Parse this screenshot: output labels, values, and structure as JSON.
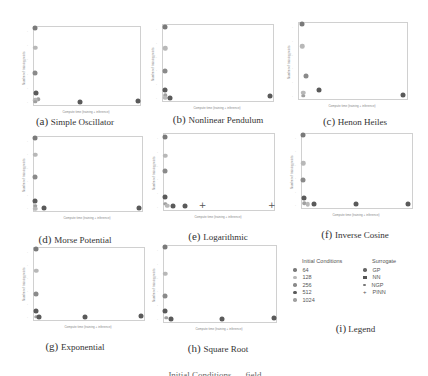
{
  "figure": {
    "bottom_caption_partial": "… Initial Conditions … field …"
  },
  "colors": {
    "ic_64": "#7a7a7a",
    "ic_128": "#b8b8b8",
    "ic_256": "#8a8a8a",
    "ic_512": "#5a5a5a",
    "ic_1024": "#a0a0a0",
    "GP": "#666666",
    "NN": "#555555",
    "NGP": "#777777",
    "PINN": "#555555"
  },
  "legend": {
    "caption_tag": "(i)",
    "caption_text": "Legend",
    "initial_conditions_title": "Initial Conditions",
    "initial_conditions": [
      "64",
      "128",
      "256",
      "512",
      "1024"
    ],
    "surrogate_title": "Surrogate",
    "surrogates": [
      "GP",
      "NN",
      "NGP",
      "PINN"
    ]
  },
  "chart_data": [
    {
      "type": "scatter",
      "id": "a",
      "title": "Simple Oscillator",
      "caption_tag": "(a)",
      "xlabel": "Compute time (training + inference)",
      "ylabel": "Number of training points",
      "grid": false,
      "points": [
        {
          "x": 0.02,
          "y": 0.97,
          "ic": "64"
        },
        {
          "x": 0.02,
          "y": 0.72,
          "ic": "128"
        },
        {
          "x": 0.02,
          "y": 0.4,
          "ic": "256"
        },
        {
          "x": 0.03,
          "y": 0.14,
          "ic": "512"
        },
        {
          "x": 0.05,
          "y": 0.06,
          "ic": "1024"
        },
        {
          "x": 0.02,
          "y": 0.05,
          "ic": "128"
        },
        {
          "x": 0.02,
          "y": 0.03,
          "ic": "1024"
        },
        {
          "x": 0.44,
          "y": 0.03,
          "ic": "512"
        },
        {
          "x": 0.99,
          "y": 0.04,
          "ic": "512"
        }
      ]
    },
    {
      "type": "scatter",
      "id": "b",
      "title": "Nonlinear Pendulum",
      "caption_tag": "(b)",
      "xlabel": "Compute time (training + inference)",
      "ylabel": "Number of training points",
      "grid": false,
      "points": [
        {
          "x": 0.03,
          "y": 0.96,
          "ic": "64"
        },
        {
          "x": 0.03,
          "y": 0.68,
          "ic": "128"
        },
        {
          "x": 0.03,
          "y": 0.38,
          "ic": "256"
        },
        {
          "x": 0.03,
          "y": 0.13,
          "ic": "512"
        },
        {
          "x": 0.03,
          "y": 0.06,
          "ic": "1024"
        },
        {
          "x": 0.03,
          "y": 0.03,
          "ic": "128"
        },
        {
          "x": 0.07,
          "y": 0.03,
          "ic": "512"
        },
        {
          "x": 0.98,
          "y": 0.05,
          "ic": "512"
        }
      ]
    },
    {
      "type": "scatter",
      "id": "c",
      "title": "Henon Heiles",
      "caption_tag": "(c)",
      "xlabel": "Compute time (training + inference)",
      "ylabel": "Number of training points",
      "grid": false,
      "points": [
        {
          "x": 0.04,
          "y": 0.97,
          "ic": "64"
        },
        {
          "x": 0.04,
          "y": 0.68,
          "ic": "128"
        },
        {
          "x": 0.07,
          "y": 0.29,
          "ic": "256"
        },
        {
          "x": 0.19,
          "y": 0.1,
          "ic": "512"
        },
        {
          "x": 0.05,
          "y": 0.07,
          "ic": "128"
        },
        {
          "x": 0.05,
          "y": 0.03,
          "ic": "1024"
        },
        {
          "x": 0.97,
          "y": 0.04,
          "ic": "512"
        }
      ]
    },
    {
      "type": "scatter",
      "id": "d",
      "title": "Morse Potential",
      "caption_tag": "(d)",
      "xlabel": "Compute time (training + inference)",
      "ylabel": "Number of training points",
      "grid": false,
      "points": [
        {
          "x": 0.02,
          "y": 0.97,
          "ic": "64"
        },
        {
          "x": 0.02,
          "y": 0.75,
          "ic": "128"
        },
        {
          "x": 0.02,
          "y": 0.44,
          "ic": "256"
        },
        {
          "x": 0.02,
          "y": 0.12,
          "ic": "512"
        },
        {
          "x": 0.02,
          "y": 0.06,
          "ic": "1024"
        },
        {
          "x": 0.02,
          "y": 0.02,
          "ic": "128"
        },
        {
          "x": 0.1,
          "y": 0.03,
          "ic": "512"
        },
        {
          "x": 0.98,
          "y": 0.03,
          "ic": "512"
        }
      ]
    },
    {
      "type": "scatter",
      "id": "e",
      "title": "Logarithmic",
      "caption_tag": "(e)",
      "xlabel": "Compute time (training + inference)",
      "ylabel": "Number of training points",
      "grid": false,
      "points": [
        {
          "x": 0.02,
          "y": 0.95,
          "ic": "64"
        },
        {
          "x": 0.02,
          "y": 0.7,
          "ic": "128"
        },
        {
          "x": 0.02,
          "y": 0.5,
          "ic": "256"
        },
        {
          "x": 0.02,
          "y": 0.16,
          "ic": "512"
        },
        {
          "x": 0.02,
          "y": 0.07,
          "ic": "1024"
        },
        {
          "x": 0.04,
          "y": 0.04,
          "ic": "128"
        },
        {
          "x": 0.09,
          "y": 0.04,
          "ic": "512"
        },
        {
          "x": 0.2,
          "y": 0.04,
          "ic": "512"
        },
        {
          "x": 0.36,
          "y": 0.05,
          "ic": "PINN"
        },
        {
          "x": 0.99,
          "y": 0.05,
          "ic": "PINN"
        }
      ]
    },
    {
      "type": "scatter",
      "id": "f",
      "title": "Inverse Cosine",
      "caption_tag": "(f)",
      "xlabel": "Compute time (training + inference)",
      "ylabel": "Number of training points",
      "grid": false,
      "points": [
        {
          "x": 0.02,
          "y": 0.97,
          "ic": "64"
        },
        {
          "x": 0.02,
          "y": 0.59,
          "ic": "128"
        },
        {
          "x": 0.02,
          "y": 0.36,
          "ic": "256"
        },
        {
          "x": 0.03,
          "y": 0.12,
          "ic": "512"
        },
        {
          "x": 0.03,
          "y": 0.05,
          "ic": "1024"
        },
        {
          "x": 0.06,
          "y": 0.04,
          "ic": "128"
        },
        {
          "x": 0.12,
          "y": 0.04,
          "ic": "512"
        },
        {
          "x": 0.5,
          "y": 0.04,
          "ic": "512"
        },
        {
          "x": 0.97,
          "y": 0.04,
          "ic": "512"
        }
      ]
    },
    {
      "type": "scatter",
      "id": "g",
      "title": "Exponential",
      "caption_tag": "(g)",
      "xlabel": "Compute time (training + inference)",
      "ylabel": "Number of training points",
      "grid": false,
      "points": [
        {
          "x": 0.03,
          "y": 0.97,
          "ic": "64"
        },
        {
          "x": 0.03,
          "y": 0.67,
          "ic": "128"
        },
        {
          "x": 0.03,
          "y": 0.35,
          "ic": "256"
        },
        {
          "x": 0.03,
          "y": 0.11,
          "ic": "512"
        },
        {
          "x": 0.03,
          "y": 0.03,
          "ic": "1024"
        },
        {
          "x": 0.05,
          "y": 0.03,
          "ic": "512"
        },
        {
          "x": 0.47,
          "y": 0.03,
          "ic": "512"
        },
        {
          "x": 0.98,
          "y": 0.04,
          "ic": "512"
        }
      ]
    },
    {
      "type": "scatter",
      "id": "h",
      "title": "Square Root",
      "caption_tag": "(h)",
      "xlabel": "Compute time (training + inference)",
      "ylabel": "Number of training points",
      "grid": false,
      "points": [
        {
          "x": 0.02,
          "y": 0.97,
          "ic": "64"
        },
        {
          "x": 0.02,
          "y": 0.62,
          "ic": "128"
        },
        {
          "x": 0.02,
          "y": 0.33,
          "ic": "256"
        },
        {
          "x": 0.02,
          "y": 0.13,
          "ic": "512"
        },
        {
          "x": 0.03,
          "y": 0.04,
          "ic": "1024"
        },
        {
          "x": 0.07,
          "y": 0.03,
          "ic": "512"
        },
        {
          "x": 0.53,
          "y": 0.03,
          "ic": "512"
        },
        {
          "x": 0.99,
          "y": 0.04,
          "ic": "512"
        }
      ]
    }
  ]
}
